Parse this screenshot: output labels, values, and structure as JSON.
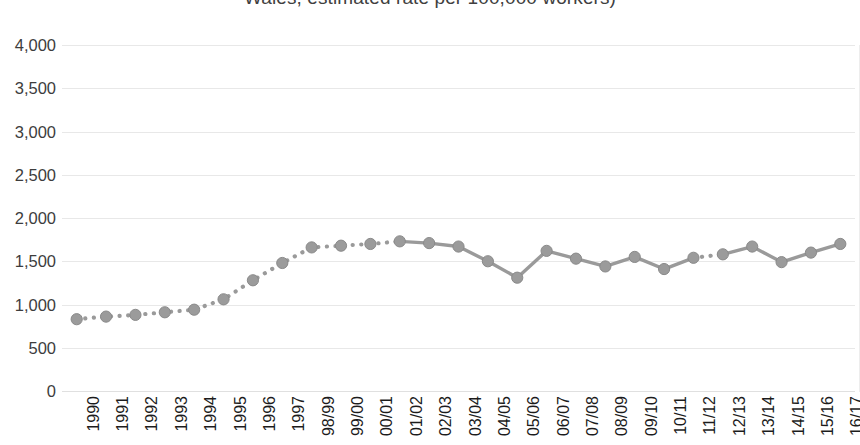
{
  "chart_data": {
    "type": "line",
    "title": "Wales, estimated rate per 100,000 workers)",
    "xlabel": "",
    "ylabel": "",
    "ylim": [
      0,
      4000
    ],
    "ytick_step": 500,
    "grid": true,
    "legend": "none",
    "series_name": "Estimated rate per 100,000 workers",
    "series_color": "#9a9a9a",
    "marker": "circle",
    "marker_color": "#9b9b9b",
    "categories": [
      "1990",
      "1991",
      "1992",
      "1993",
      "1994",
      "1995",
      "1996",
      "1997",
      "98/99",
      "99/00",
      "00/01",
      "01/02",
      "02/03",
      "03/04",
      "04/05",
      "05/06",
      "06/07",
      "07/08",
      "08/09",
      "09/10",
      "10/11",
      "11/12",
      "12/13",
      "13/14",
      "14/15",
      "15/16",
      "16/17"
    ],
    "values": [
      830,
      860,
      880,
      910,
      940,
      1060,
      1280,
      1480,
      1660,
      1680,
      1700,
      1730,
      1710,
      1670,
      1500,
      1310,
      1620,
      1530,
      1440,
      1550,
      1410,
      1540,
      1580,
      1670,
      1490,
      1600,
      1700
    ],
    "dotted_through_index": 11,
    "dotted_gap_segments": [
      [
        21,
        22
      ]
    ],
    "ytick_labels": [
      "4,000",
      "3,500",
      "3,000",
      "2,500",
      "2,000",
      "1,500",
      "1,000",
      "500",
      "0"
    ],
    "yticks": [
      4000,
      3500,
      3000,
      2500,
      2000,
      1500,
      1000,
      500,
      0
    ]
  }
}
